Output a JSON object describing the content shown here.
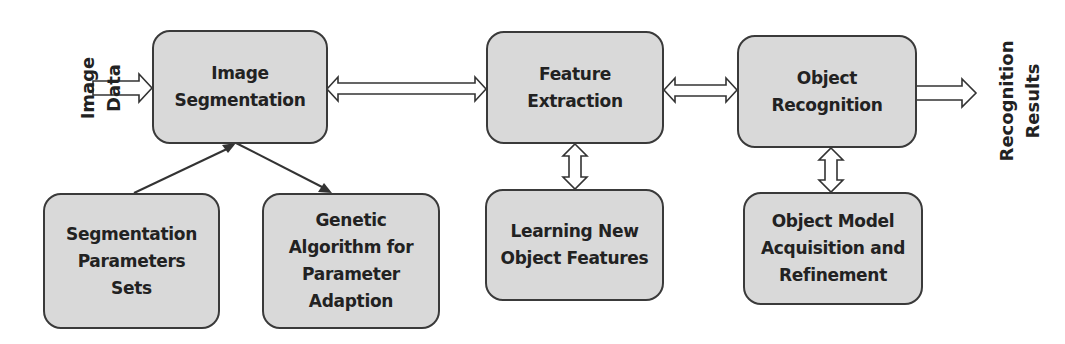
{
  "diagram": {
    "type": "flowchart",
    "input_label": "Image Data",
    "output_label": "Recognition\nResults",
    "nodes": [
      {
        "id": "image-segmentation",
        "label": "Image\nSegmentation"
      },
      {
        "id": "feature-extraction",
        "label": "Feature\nExtraction"
      },
      {
        "id": "object-recognition",
        "label": "Object\nRecognition"
      },
      {
        "id": "segmentation-parameters-sets",
        "label": "Segmentation\nParameters\nSets"
      },
      {
        "id": "genetic-algorithm",
        "label": "Genetic\nAlgorithm for\nParameter\nAdaption"
      },
      {
        "id": "learning-new-object-features",
        "label": "Learning New\nObject Features"
      },
      {
        "id": "object-model-acquisition",
        "label": "Object Model\nAcquisition and\nRefinement"
      }
    ],
    "edges": [
      {
        "from": "Image Data",
        "to": "image-segmentation",
        "style": "block-arrow"
      },
      {
        "from": "image-segmentation",
        "to": "feature-extraction",
        "style": "double-block-arrow"
      },
      {
        "from": "feature-extraction",
        "to": "object-recognition",
        "style": "double-block-arrow"
      },
      {
        "from": "object-recognition",
        "to": "Recognition Results",
        "style": "block-arrow"
      },
      {
        "from": "segmentation-parameters-sets",
        "to": "image-segmentation",
        "style": "line-arrow"
      },
      {
        "from": "image-segmentation",
        "to": "genetic-algorithm",
        "style": "line-arrow"
      },
      {
        "from": "feature-extraction",
        "to": "learning-new-object-features",
        "style": "double-block-arrow"
      },
      {
        "from": "object-recognition",
        "to": "object-model-acquisition",
        "style": "double-block-arrow"
      }
    ],
    "colors": {
      "box_fill": "#d9d9d9",
      "box_border": "#3a3a3a",
      "text": "#222222",
      "arrow_fill": "#ffffff"
    }
  }
}
